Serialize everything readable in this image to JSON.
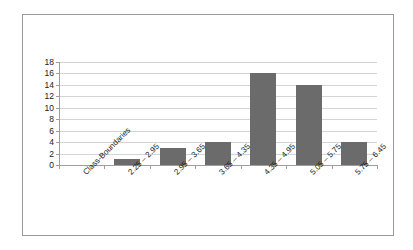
{
  "chart_data": {
    "type": "bar",
    "title": "",
    "subtitle": "",
    "xlabel": "Class-Boundaries",
    "ylabel": "",
    "categories": [
      "Class-Boundaries",
      "2.25 – 2.95",
      "2.95 – 3.65",
      "3.65 – 4.35",
      "4.35 – 4.95",
      "5.05 – 5.75",
      "5.75 – 6.45"
    ],
    "values": [
      0,
      1,
      3,
      4,
      16,
      14,
      4
    ],
    "ylim": [
      0,
      18
    ],
    "ytick_step": 2,
    "yticks": [
      0,
      2,
      4,
      6,
      8,
      10,
      12,
      14,
      16,
      18
    ],
    "ytick_labels": [
      "0",
      "2",
      "4",
      "6",
      "8",
      "10",
      "12",
      "14",
      "16",
      "18"
    ],
    "grid": true,
    "grid_axis": "y",
    "legend": false,
    "legend_position": "none",
    "annotations": [],
    "bar_color": "#6b6b6b",
    "grid_color": "#d4d4d4",
    "axis_color": "#9e9e9e",
    "frame_color": "#9a9a9a",
    "background_color": "#ffffff",
    "label_rotation": -45
  }
}
